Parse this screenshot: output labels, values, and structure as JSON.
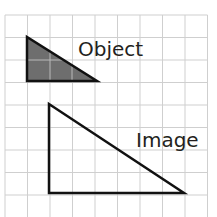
{
  "diagram": {
    "type": "grid-dilation",
    "grid": {
      "x0": 5,
      "y0": 15,
      "cell": 22.5,
      "cols": 9,
      "rows": 9,
      "line_color": "#cfcfcf"
    },
    "object": {
      "label": "Object",
      "vertices_px": [
        [
          27,
          37
        ],
        [
          27,
          81
        ],
        [
          97,
          81
        ]
      ],
      "fill": "#6e6e6e",
      "stroke": "#111111"
    },
    "image": {
      "label": "Image",
      "vertices_px": [
        [
          49,
          104
        ],
        [
          49,
          193
        ],
        [
          184,
          193
        ]
      ],
      "fill": "none",
      "stroke": "#111111"
    }
  }
}
